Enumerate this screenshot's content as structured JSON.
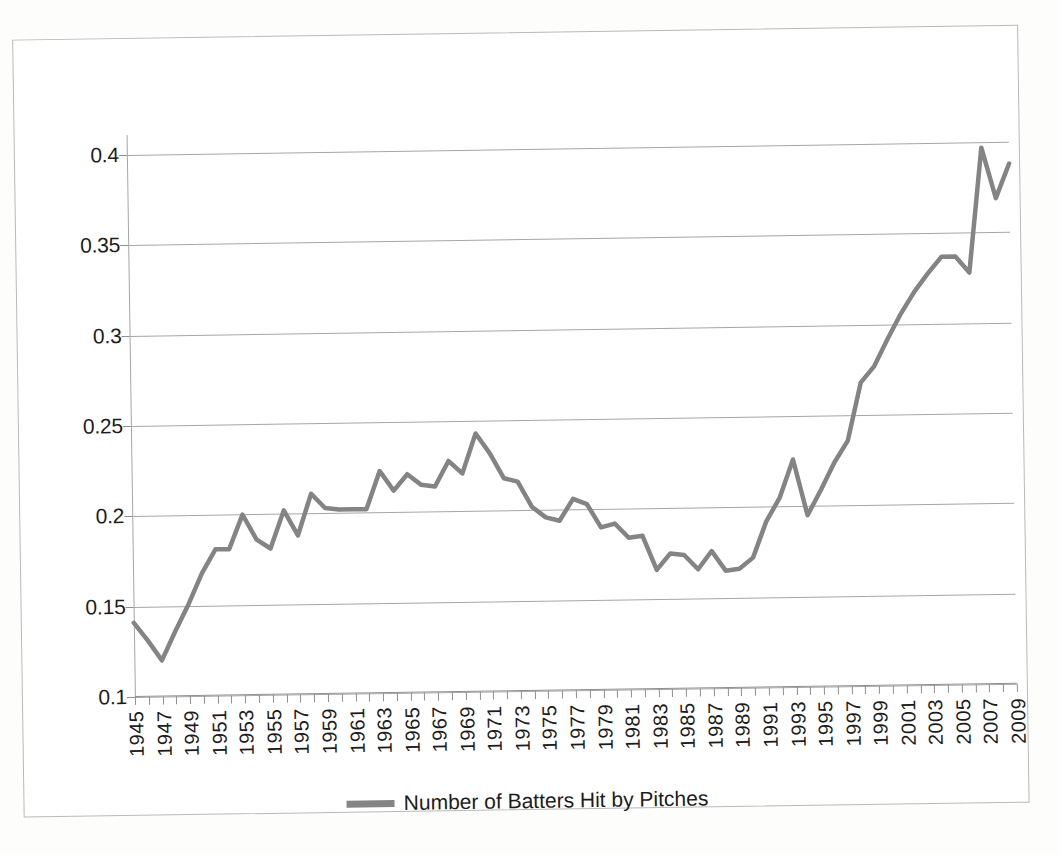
{
  "chart_data": {
    "type": "line",
    "title": "",
    "xlabel": "",
    "ylabel": "",
    "xlim": [
      1945,
      2009
    ],
    "ylim": [
      0.1,
      0.4
    ],
    "grid": true,
    "legend_position": "bottom",
    "ytick_labels": [
      "0.4",
      "0.35",
      "0.3",
      "0.25",
      "0.2",
      "0.15",
      "0.1"
    ],
    "ytick_values": [
      0.4,
      0.35,
      0.3,
      0.25,
      0.2,
      0.15,
      0.1
    ],
    "xtick_labels": [
      "1945",
      "1947",
      "1949",
      "1951",
      "1953",
      "1955",
      "1957",
      "1959",
      "1961",
      "1963",
      "1965",
      "1967",
      "1969",
      "1971",
      "1973",
      "1975",
      "1977",
      "1979",
      "1981",
      "1983",
      "1985",
      "1987",
      "1989",
      "1991",
      "1993",
      "1995",
      "1997",
      "1999",
      "2001",
      "2003",
      "2005",
      "2007",
      "2009"
    ],
    "xtick_step": 2,
    "series": [
      {
        "name": "Number of Batters Hit by Pitches",
        "color": "#848484",
        "x": [
          1945,
          1946,
          1947,
          1948,
          1949,
          1950,
          1951,
          1952,
          1953,
          1954,
          1955,
          1956,
          1957,
          1958,
          1959,
          1960,
          1961,
          1962,
          1963,
          1964,
          1965,
          1966,
          1967,
          1968,
          1969,
          1970,
          1971,
          1972,
          1973,
          1974,
          1975,
          1976,
          1977,
          1978,
          1979,
          1980,
          1981,
          1982,
          1983,
          1984,
          1985,
          1986,
          1987,
          1988,
          1989,
          1990,
          1991,
          1992,
          1993,
          1994,
          1995,
          1996,
          1997,
          1998,
          1999,
          2000,
          2001,
          2002,
          2003,
          2004,
          2005,
          2006,
          2007,
          2008,
          2009
        ],
        "values": [
          0.141,
          0.131,
          0.12,
          0.136,
          0.151,
          0.168,
          0.181,
          0.181,
          0.2,
          0.186,
          0.181,
          0.202,
          0.188,
          0.211,
          0.203,
          0.202,
          0.202,
          0.202,
          0.223,
          0.212,
          0.221,
          0.215,
          0.214,
          0.228,
          0.221,
          0.243,
          0.232,
          0.218,
          0.216,
          0.202,
          0.196,
          0.194,
          0.206,
          0.203,
          0.19,
          0.192,
          0.184,
          0.185,
          0.166,
          0.175,
          0.174,
          0.166,
          0.176,
          0.165,
          0.166,
          0.172,
          0.192,
          0.205,
          0.226,
          0.195,
          0.209,
          0.224,
          0.236,
          0.268,
          0.277,
          0.292,
          0.306,
          0.318,
          0.328,
          0.337,
          0.337,
          0.328,
          0.397,
          0.369,
          0.388
        ],
        "note": "65 annual points, 1945 through 2009"
      }
    ],
    "series_correction": {
      "comment": "values aligned so that the visible peaks land on the correct years",
      "x": [
        1945,
        1946,
        1947,
        1948,
        1949,
        1950,
        1951,
        1952,
        1953,
        1954,
        1955,
        1956,
        1957,
        1958,
        1959,
        1960,
        1961,
        1962,
        1963,
        1964,
        1965,
        1966,
        1967,
        1968,
        1969,
        1970,
        1971,
        1972,
        1973,
        1974,
        1975,
        1976,
        1977,
        1978,
        1979,
        1980,
        1981,
        1982,
        1983,
        1984,
        1985,
        1986,
        1987,
        1988,
        1989,
        1990,
        1991,
        1992,
        1993,
        1994,
        1995,
        1996,
        1997,
        1998,
        1999,
        2000,
        2001,
        2002,
        2003,
        2004,
        2005,
        2006,
        2007,
        2008,
        2009
      ],
      "values": [
        0.141,
        0.131,
        0.12,
        0.136,
        0.151,
        0.168,
        0.181,
        0.181,
        0.2,
        0.186,
        0.181,
        0.202,
        0.188,
        0.211,
        0.203,
        0.202,
        0.202,
        0.202,
        0.223,
        0.212,
        0.221,
        0.215,
        0.216,
        0.228,
        0.221,
        0.243,
        0.232,
        0.218,
        0.216,
        0.202,
        0.196,
        0.194,
        0.206,
        0.203,
        0.19,
        0.192,
        0.184,
        0.185,
        0.166,
        0.175,
        0.174,
        0.166,
        0.176,
        0.165,
        0.166,
        0.172,
        0.192,
        0.205,
        0.226,
        0.195,
        0.209,
        0.224,
        0.236,
        0.268,
        0.277,
        0.292,
        0.306,
        0.318,
        0.328,
        0.337,
        0.337,
        0.328,
        0.397,
        0.369,
        0.388
      ]
    }
  },
  "legend": {
    "label": "Number of Batters Hit by Pitches",
    "swatch_color": "#848484"
  },
  "colors": {
    "line": "#848484",
    "grid": "#a6a6a6",
    "axis": "#8f8f8f",
    "frame": "#b9b9b9",
    "text": "#1c1c1c",
    "background": "#ffffff"
  }
}
